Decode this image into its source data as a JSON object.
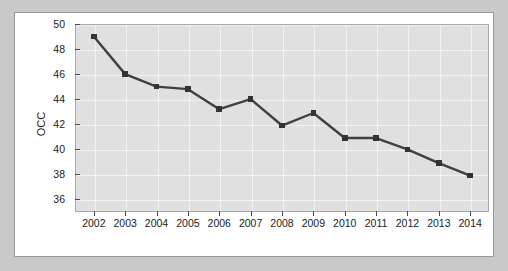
{
  "chart_data": {
    "type": "line",
    "title": "",
    "subtitle": "",
    "xlabel": "",
    "ylabel": "OCC",
    "categories": [
      "2002",
      "2003",
      "2004",
      "2005",
      "2006",
      "2007",
      "2008",
      "2009",
      "2010",
      "2011",
      "2012",
      "2013",
      "2014"
    ],
    "x": [
      2002,
      2003,
      2004,
      2005,
      2006,
      2007,
      2008,
      2009,
      2010,
      2011,
      2012,
      2013,
      2014
    ],
    "values": [
      49.0,
      46.0,
      45.0,
      44.8,
      43.2,
      44.0,
      41.9,
      42.9,
      40.9,
      40.9,
      40.0,
      38.9,
      37.9
    ],
    "series": [
      {
        "name": "OCC",
        "values": [
          49.0,
          46.0,
          45.0,
          44.8,
          43.2,
          44.0,
          41.9,
          42.9,
          40.9,
          40.9,
          40.0,
          38.9,
          37.9
        ]
      }
    ],
    "ylim": [
      35.0,
      50.0
    ],
    "xlim": [
      2001.4,
      2014.6
    ],
    "yticks": [
      36,
      38,
      40,
      42,
      44,
      46,
      48,
      50
    ],
    "ytick_labels": [
      "36",
      "38",
      "40",
      "42",
      "44",
      "46",
      "48",
      "50"
    ],
    "xticks": [
      2002,
      2003,
      2004,
      2005,
      2006,
      2007,
      2008,
      2009,
      2010,
      2011,
      2012,
      2013,
      2014
    ],
    "xtick_labels": [
      "2002",
      "2003",
      "2004",
      "2005",
      "2006",
      "2007",
      "2008",
      "2009",
      "2010",
      "2011",
      "2012",
      "2013",
      "2014"
    ],
    "grid": true,
    "grid_color": "#f2f2f2",
    "legend": false,
    "legend_position": "none",
    "marker": "square",
    "line_color": "#404040",
    "marker_color": "#333333",
    "plot_background": "#e0e0e0",
    "figure_background": "#ffffff",
    "page_background": "#c9c9c9",
    "annotations": []
  }
}
